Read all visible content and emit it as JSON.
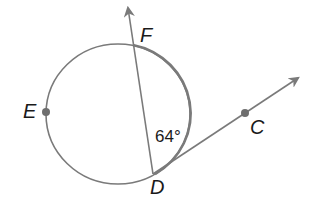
{
  "diagram": {
    "type": "circle-secant-tangent",
    "points": {
      "E": {
        "label": "E",
        "on": "circle"
      },
      "F": {
        "label": "F",
        "on": "circle"
      },
      "D": {
        "label": "D",
        "on": "circle",
        "role": "point of tangency"
      },
      "C": {
        "label": "C",
        "on": "tangent ray DC"
      }
    },
    "angle": {
      "label": "64°",
      "vertex": "D",
      "between": [
        "DF",
        "DC"
      ],
      "arc": "FD"
    },
    "rays": [
      {
        "name": "ray-DF",
        "from": "D",
        "through": "F"
      },
      {
        "name": "ray-DC",
        "from": "D",
        "through": "C"
      }
    ],
    "colors": {
      "stroke": "#7a7a7a",
      "highlight_arc": "#7a7a7a",
      "text": "#1a1a1a",
      "point": "#6e6e6e"
    }
  }
}
